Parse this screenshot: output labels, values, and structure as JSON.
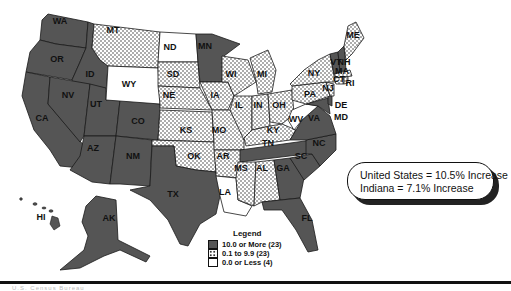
{
  "map": {
    "title": "",
    "legend": {
      "title": "Legend",
      "items": [
        {
          "label": "10.0 or More (23)",
          "pattern": "dark",
          "color": "#555555"
        },
        {
          "label": "0.1 to 9.9 (23)",
          "pattern": "dotted",
          "color": "#ffffff"
        },
        {
          "label": "0.0 or Less (4)",
          "pattern": "white",
          "color": "#ffffff"
        }
      ]
    },
    "callout": {
      "line1": "United States = 10.5% Increase",
      "line2": "Indiana = 7.1% Increase"
    },
    "states": {
      "WA": "dark",
      "OR": "dark",
      "CA": "dark",
      "ID": "dark",
      "NV": "dark",
      "UT": "dark",
      "AZ": "dark",
      "CO": "dark",
      "NM": "dark",
      "TX": "dark",
      "MN": "dark",
      "TN": "dark",
      "NC": "dark",
      "SC": "dark",
      "GA": "dark",
      "FL": "dark",
      "VA": "dark",
      "MD": "dark",
      "DE": "dark",
      "VT": "dark",
      "NH": "dark",
      "AK": "dark",
      "HI": "dark",
      "MT": "dotted",
      "SD": "dotted",
      "NE": "dotted",
      "KS": "dotted",
      "OK": "dotted",
      "IA": "dotted",
      "MO": "dotted",
      "AR": "dotted",
      "WI": "dotted",
      "MI": "dotted",
      "IL": "dotted",
      "IN": "dotted",
      "OH": "dotted",
      "KY": "dotted",
      "MS": "dotted",
      "AL": "dotted",
      "PA": "dotted",
      "NY": "dotted",
      "ME": "dotted",
      "MA": "dotted",
      "CT": "dotted",
      "RI": "dotted",
      "NJ": "dotted",
      "ND": "white",
      "WY": "white",
      "WV": "white",
      "LA": "white"
    },
    "labels": [
      "WA",
      "OR",
      "CA",
      "ID",
      "NV",
      "UT",
      "AZ",
      "MT",
      "WY",
      "CO",
      "NM",
      "ND",
      "SD",
      "NE",
      "KS",
      "OK",
      "TX",
      "MN",
      "IA",
      "MO",
      "AR",
      "LA",
      "WI",
      "IL",
      "MI",
      "IN",
      "OH",
      "KY",
      "TN",
      "MS",
      "AL",
      "GA",
      "FL",
      "SC",
      "NC",
      "VA",
      "WV",
      "PA",
      "NY",
      "VT",
      "NH",
      "ME",
      "MA",
      "CT",
      "RI",
      "NJ",
      "DE",
      "MD",
      "AK",
      "HI"
    ],
    "colors": {
      "dark": "#555555",
      "dotted_bg": "#ffffff",
      "dot": "#333333",
      "white": "#ffffff",
      "outline": "#1a1a1a"
    }
  },
  "footer": {
    "text": "U.S. Census Bureau"
  }
}
